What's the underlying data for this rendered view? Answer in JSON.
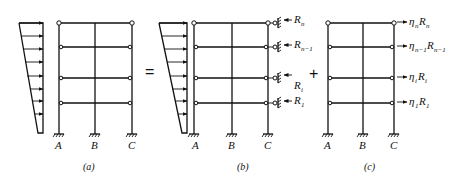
{
  "figure": {
    "panels": [
      {
        "id": "a",
        "caption": "(a)",
        "columns": [
          "A",
          "B",
          "C"
        ],
        "description": "Frame under triangular lateral load"
      },
      {
        "id": "b",
        "caption": "(b)",
        "columns": [
          "A",
          "B",
          "C"
        ],
        "description": "Frame with lateral restraints",
        "reactions": [
          "R_n",
          "R_n-1",
          "R_i",
          "R_1"
        ]
      },
      {
        "id": "c",
        "caption": "(c)",
        "columns": [
          "A",
          "B",
          "C"
        ],
        "description": "Frame with amplified reversed reactions",
        "loads": [
          "η_n R_n",
          "η_n-1 R_n-1",
          "η_i R_i",
          "η_1 R_1"
        ]
      }
    ],
    "operators": {
      "equals": "=",
      "plus": "+"
    },
    "labels": {
      "col_A": "A",
      "col_B": "B",
      "col_C": "C",
      "cap_a": "(a)",
      "cap_b": "(b)",
      "cap_c": "(c)",
      "R": "R",
      "eta": "η",
      "sub_n": "n",
      "sub_n1": "n−1",
      "sub_i": "i",
      "sub_1": "1"
    }
  }
}
